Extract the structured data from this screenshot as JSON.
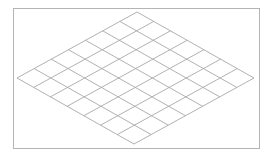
{
  "diagram": {
    "type": "isometric-grid",
    "rows": 7,
    "cols": 7,
    "frame": {
      "x": 13,
      "y": 8,
      "width": 246,
      "height": 140,
      "stroke": "#b4b4b4"
    },
    "vertices": {
      "left": [
        17,
        78
      ],
      "top": [
        137,
        12
      ],
      "right": [
        254,
        78
      ],
      "bottom": [
        134,
        144
      ]
    },
    "line_color": "#a8a8a8",
    "background": "#ffffff"
  }
}
